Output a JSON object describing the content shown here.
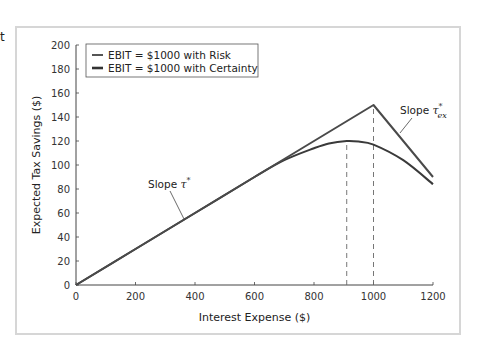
{
  "chart_data": {
    "type": "line",
    "title": "",
    "xlabel": "Interest Expense ($)",
    "ylabel": "Expected Tax Savings ($)",
    "xlim": [
      0,
      1200
    ],
    "ylim": [
      0,
      200
    ],
    "x_ticks": [
      0,
      200,
      400,
      600,
      800,
      1000,
      1200
    ],
    "y_ticks": [
      0,
      20,
      40,
      60,
      80,
      100,
      120,
      140,
      160,
      180,
      200
    ],
    "grid": false,
    "legend_position": "upper-left",
    "series": [
      {
        "name": "EBIT = $1000 with Risk",
        "color": "#3a3a3a",
        "x": [
          0,
          200,
          400,
          600,
          700,
          800,
          850,
          910,
          950,
          1000,
          1100,
          1200
        ],
        "y": [
          0,
          30,
          60,
          90,
          104,
          114,
          118,
          120,
          119.5,
          117,
          104,
          84
        ]
      },
      {
        "name": "EBIT = $1000 with Certainty",
        "color": "#4a4a4a",
        "x": [
          0,
          1000,
          1200
        ],
        "y": [
          0,
          150,
          90
        ]
      }
    ],
    "reference_lines": [
      {
        "type": "vertical-dashed",
        "x": 910,
        "y_top": 120
      },
      {
        "type": "vertical-dashed",
        "x": 1000,
        "y_top": 150
      }
    ],
    "annotations": [
      {
        "text": "Slope τ*",
        "points_to": "initial linear segment",
        "x": 350,
        "y": 53
      },
      {
        "text": "Slope τ*ex",
        "points_to": "declining segment after 1000",
        "x": 1100,
        "y": 120
      }
    ]
  },
  "labels": {
    "edge_char": "t",
    "slope_left_prefix": "Slope ",
    "slope_left_symbol": "τ",
    "slope_left_sup": "*",
    "slope_right_prefix": "Slope ",
    "slope_right_symbol": "τ",
    "slope_right_sup": "*",
    "slope_right_sub": "ex"
  }
}
